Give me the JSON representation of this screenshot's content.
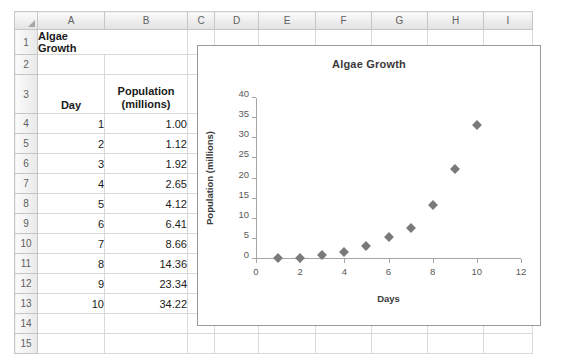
{
  "spreadsheet": {
    "column_headers": [
      "A",
      "B",
      "C",
      "D",
      "E",
      "F",
      "G",
      "H",
      "I"
    ],
    "row_headers": [
      "1",
      "2",
      "3",
      "4",
      "5",
      "6",
      "7",
      "8",
      "9",
      "10",
      "11",
      "12",
      "13",
      "14",
      "15"
    ],
    "title_cell": "Algae Growth",
    "headers": {
      "day": "Day",
      "population_line1": "Population",
      "population_line2": "(millions)"
    },
    "rows": [
      {
        "day": "1",
        "population": "1.00"
      },
      {
        "day": "2",
        "population": "1.12"
      },
      {
        "day": "3",
        "population": "1.92"
      },
      {
        "day": "4",
        "population": "2.65"
      },
      {
        "day": "5",
        "population": "4.12"
      },
      {
        "day": "6",
        "population": "6.41"
      },
      {
        "day": "7",
        "population": "8.66"
      },
      {
        "day": "8",
        "population": "14.36"
      },
      {
        "day": "9",
        "population": "23.34"
      },
      {
        "day": "10",
        "population": "34.22"
      }
    ]
  },
  "chart_data": {
    "type": "scatter",
    "title": "Algae Growth",
    "xlabel": "Days",
    "ylabel": "Population (millions)",
    "x": [
      1,
      2,
      3,
      4,
      5,
      6,
      7,
      8,
      9,
      10
    ],
    "values": [
      1.0,
      1.12,
      1.92,
      2.65,
      4.12,
      6.41,
      8.66,
      14.36,
      23.34,
      34.22
    ],
    "xlim": [
      0,
      12
    ],
    "ylim": [
      0,
      40
    ],
    "xticks": [
      0,
      2,
      4,
      6,
      8,
      10,
      12
    ],
    "yticks": [
      0,
      5,
      10,
      15,
      20,
      25,
      30,
      35,
      40
    ],
    "grid": false,
    "legend": false,
    "marker": "diamond",
    "marker_color": "#7a7a7a"
  }
}
